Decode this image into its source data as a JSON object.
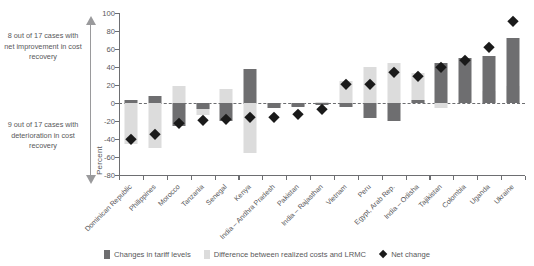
{
  "chart_data": {
    "type": "bar",
    "title": "",
    "xlabel": "",
    "ylabel": "Percent",
    "ylim": [
      -80,
      100
    ],
    "yticks": [
      100,
      80,
      60,
      40,
      20,
      0,
      -20,
      -40,
      -60,
      -80
    ],
    "grid": false,
    "zero_reference_line": true,
    "legend_position": "bottom",
    "categories": [
      "Dominican Republic",
      "Philippines",
      "Morocco",
      "Tanzania",
      "Senegal",
      "Kenya",
      "India – Andhra Pradesh",
      "Pakistan",
      "India – Rajasthan",
      "Vietnam",
      "Peru",
      "Egypt, Arab Rep.",
      "India – Odisha",
      "Tajikistan",
      "Colombia",
      "Uganda",
      "Ukraine"
    ],
    "series": [
      {
        "name": "Changes in tariff levels",
        "color": "#6e6e70",
        "values": [
          3,
          8,
          -25,
          -7,
          -20,
          38,
          -6,
          -4,
          -2,
          -4,
          -17,
          -20,
          3,
          45,
          50,
          52,
          72
        ]
      },
      {
        "name": "Difference between realized costs and LRMC",
        "color": "#dcdcdc",
        "values": [
          -46,
          -50,
          19,
          -13,
          16,
          -55,
          -2,
          -3,
          1,
          25,
          40,
          45,
          33,
          -5,
          0,
          13,
          19
        ]
      },
      {
        "name": "Net change",
        "color": "#1a1a1a",
        "marker": "diamond",
        "values": [
          -40,
          -34,
          -22,
          -19,
          -18,
          -16,
          -16,
          -12,
          -7,
          21,
          21,
          35,
          30,
          40,
          48,
          62,
          91
        ]
      }
    ]
  },
  "annotations": {
    "upper": "8 out of 17 cases with net improvement in cost recovery",
    "lower": "9 out of 17 cases with deterioration in cost recovery"
  },
  "legend": {
    "items": [
      {
        "label": "Changes in tariff levels",
        "swatch": "dark"
      },
      {
        "label": "Difference between realized costs and LRMC",
        "swatch": "light"
      },
      {
        "label": "Net change",
        "swatch": "diamond"
      }
    ]
  },
  "colors": {
    "tariff": "#6e6e70",
    "lrmc": "#dcdcdc",
    "net": "#1a1a1a",
    "axis": "#6d6e71",
    "text": "#58585a",
    "arrow": "#9a9a9c"
  }
}
